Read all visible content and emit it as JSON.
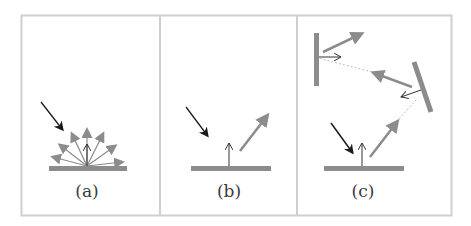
{
  "figure": {
    "panels": [
      {
        "id": "a",
        "label": "(a)",
        "description": "Diffuse reflection: incident ray scattered in many directions",
        "elements": [
          "incident-ray",
          "surface-normal",
          "scattered-rays",
          "surface"
        ]
      },
      {
        "id": "b",
        "label": "(b)",
        "description": "Specular reflection: incident ray reflected in a single direction",
        "elements": [
          "incident-ray",
          "surface-normal",
          "reflected-ray",
          "surface"
        ]
      },
      {
        "id": "c",
        "label": "(c)",
        "description": "Multiple reflections between surfaces (ray tracing)",
        "elements": [
          "incident-ray",
          "surface-normal",
          "reflected-ray",
          "secondary-mirror",
          "tertiary-mirror",
          "dotted-path"
        ]
      }
    ],
    "colors": {
      "frame": "#cfcfcf",
      "surface": "#8c8c8c",
      "incident_arrow": "#1a1a1a",
      "reflected_arrow": "#8c8c8c",
      "normal_arrow": "#333333",
      "dotted_path": "#bdbdbd",
      "label": "#3a3a3a"
    }
  }
}
